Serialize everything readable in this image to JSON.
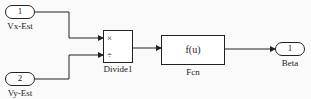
{
  "diagram": {
    "inports": [
      {
        "number": "1",
        "label": "Vx-Est"
      },
      {
        "number": "2",
        "label": "Vy-Est"
      }
    ],
    "divide_block": {
      "label": "Divide1",
      "signs": [
        "×",
        "÷"
      ]
    },
    "fcn_block": {
      "label": "Fcn",
      "expression": "f(u)"
    },
    "outport": {
      "number": "1",
      "label": "Beta"
    },
    "colors": {
      "line": "#222222",
      "background": "#fafafa"
    }
  }
}
